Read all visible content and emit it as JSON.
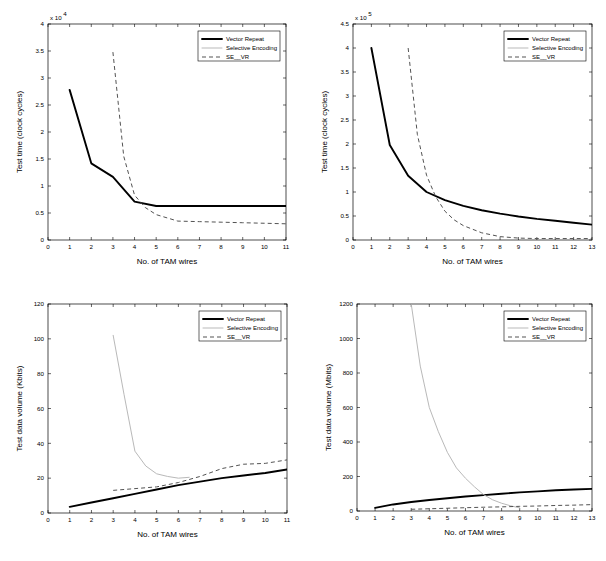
{
  "figure": {
    "title": "",
    "series_names": [
      "Vector Repeat",
      "Selective Encoding",
      "SE__VR"
    ],
    "colors": {
      "vector_repeat": "#000000",
      "selective_encoding": "#b9b9b9",
      "se_vr": "#4a4a4a",
      "axis": "#000000",
      "background": "#ffffff"
    }
  },
  "chart_data": [
    {
      "id": "top-left",
      "type": "line",
      "title": "",
      "xlabel": "No. of TAM wires",
      "ylabel": "Test time (clock cycles)",
      "y_multiplier": "x 10",
      "y_multiplier_exponent": "4",
      "xlim": [
        0,
        11
      ],
      "ylim": [
        0,
        4
      ],
      "xticks": [
        0,
        1,
        2,
        3,
        4,
        5,
        6,
        7,
        8,
        9,
        10,
        11
      ],
      "xticklabels": [
        "0",
        "1",
        "2",
        "3",
        "4",
        "5",
        "6",
        "7",
        "8",
        "9",
        "10",
        "11"
      ],
      "yticks": [
        0,
        0.5,
        1,
        1.5,
        2,
        2.5,
        3,
        3.5,
        4
      ],
      "yticklabels": [
        "0",
        "0.5",
        "1",
        "1.5",
        "2",
        "2.5",
        "3",
        "3.5",
        "4"
      ],
      "grid": false,
      "legend_position": "upper right",
      "series": [
        {
          "name": "Vector Repeat",
          "style": "solid-thick",
          "x": [
            1,
            2,
            3,
            4,
            5,
            6,
            7,
            8,
            9,
            10,
            11
          ],
          "y": [
            2.78,
            1.42,
            1.17,
            0.71,
            0.63,
            0.63,
            0.63,
            0.63,
            0.63,
            0.63,
            0.63
          ]
        },
        {
          "name": "Selective Encoding",
          "style": "solid-thin-gray",
          "x": [],
          "y": []
        },
        {
          "name": "SE__VR",
          "style": "dashed",
          "x": [
            3,
            3.5,
            4,
            4.5,
            5,
            6,
            7,
            8,
            9,
            10,
            11
          ],
          "y": [
            3.48,
            1.55,
            0.83,
            0.6,
            0.47,
            0.35,
            0.34,
            0.33,
            0.32,
            0.31,
            0.3
          ]
        }
      ]
    },
    {
      "id": "top-right",
      "type": "line",
      "title": "",
      "xlabel": "No. of TAM wires",
      "ylabel": "Test time (clock cycles)",
      "y_multiplier": "x 10",
      "y_multiplier_exponent": "5",
      "xlim": [
        0,
        13
      ],
      "ylim": [
        0,
        4.5
      ],
      "xticks": [
        0,
        1,
        2,
        3,
        4,
        5,
        6,
        7,
        8,
        9,
        10,
        11,
        12,
        13
      ],
      "xticklabels": [
        "0",
        "1",
        "2",
        "3",
        "4",
        "5",
        "6",
        "7",
        "8",
        "9",
        "10",
        "11",
        "12",
        "13"
      ],
      "yticks": [
        0,
        0.5,
        1,
        1.5,
        2,
        2.5,
        3,
        3.5,
        4,
        4.5
      ],
      "yticklabels": [
        "0",
        "0.5",
        "1",
        "1.5",
        "2",
        "2.5",
        "3",
        "3.5",
        "4",
        "4.5"
      ],
      "grid": false,
      "legend_position": "upper right",
      "series": [
        {
          "name": "Vector Repeat",
          "style": "solid-thick",
          "x": [
            1,
            2,
            3,
            4,
            5,
            6,
            7,
            8,
            9,
            10,
            11,
            12,
            13
          ],
          "y": [
            4.0,
            1.98,
            1.34,
            1.0,
            0.83,
            0.71,
            0.62,
            0.55,
            0.49,
            0.44,
            0.4,
            0.36,
            0.32
          ]
        },
        {
          "name": "Selective Encoding",
          "style": "solid-thin-gray",
          "x": [],
          "y": []
        },
        {
          "name": "SE__VR",
          "style": "dashed",
          "x": [
            3,
            3.5,
            4,
            4.5,
            5,
            5.5,
            6,
            7,
            8,
            9,
            10,
            11,
            12,
            13
          ],
          "y": [
            4.0,
            2.2,
            1.35,
            0.9,
            0.6,
            0.42,
            0.3,
            0.15,
            0.07,
            0.04,
            0.03,
            0.03,
            0.03,
            0.03
          ]
        }
      ]
    },
    {
      "id": "bottom-left",
      "type": "line",
      "title": "",
      "xlabel": "No. of TAM wires",
      "ylabel": "Test data volume (Kbits)",
      "y_multiplier": "",
      "y_multiplier_exponent": "",
      "xlim": [
        0,
        11
      ],
      "ylim": [
        0,
        120
      ],
      "xticks": [
        0,
        1,
        2,
        3,
        4,
        5,
        6,
        7,
        8,
        9,
        10,
        11
      ],
      "xticklabels": [
        "0",
        "1",
        "2",
        "3",
        "4",
        "5",
        "6",
        "7",
        "8",
        "9",
        "10",
        "11"
      ],
      "yticks": [
        0,
        20,
        40,
        60,
        80,
        100,
        120
      ],
      "yticklabels": [
        "0",
        "20",
        "40",
        "60",
        "80",
        "100",
        "120"
      ],
      "grid": false,
      "legend_position": "upper right",
      "series": [
        {
          "name": "Vector Repeat",
          "style": "solid-thick",
          "x": [
            1,
            2,
            3,
            4,
            5,
            6,
            7,
            8,
            9,
            10,
            11
          ],
          "y": [
            3.5,
            6.0,
            8.5,
            11.0,
            13.5,
            16.0,
            18.0,
            20.0,
            21.5,
            23.0,
            25.0
          ]
        },
        {
          "name": "Selective Encoding",
          "style": "solid-thin-gray",
          "x": [
            3,
            3.5,
            4,
            4.5,
            5,
            5.5,
            6,
            6.5
          ],
          "y": [
            102.0,
            68.0,
            35.5,
            27.0,
            22.5,
            21.0,
            20.0,
            20.5
          ]
        },
        {
          "name": "SE__VR",
          "style": "dashed",
          "x": [
            3,
            4,
            5,
            6,
            7,
            8,
            9,
            10,
            11
          ],
          "y": [
            13.0,
            14.0,
            15.0,
            17.5,
            21.0,
            25.5,
            28.0,
            28.5,
            30.5
          ]
        }
      ]
    },
    {
      "id": "bottom-right",
      "type": "line",
      "title": "",
      "xlabel": "No. of TAM wires",
      "ylabel": "Test data volume (Mbits)",
      "y_multiplier": "",
      "y_multiplier_exponent": "",
      "xlim": [
        0,
        13
      ],
      "ylim": [
        0,
        1200
      ],
      "xticks": [
        0,
        1,
        2,
        3,
        4,
        5,
        6,
        7,
        8,
        9,
        10,
        11,
        12,
        13
      ],
      "xticklabels": [
        "0",
        "1",
        "2",
        "3",
        "4",
        "5",
        "6",
        "7",
        "8",
        "9",
        "10",
        "11",
        "12",
        "13"
      ],
      "yticks": [
        0,
        200,
        400,
        600,
        800,
        1000,
        1200
      ],
      "yticklabels": [
        "0",
        "200",
        "400",
        "600",
        "800",
        "1000",
        "1200"
      ],
      "grid": false,
      "legend_position": "upper right",
      "series": [
        {
          "name": "Vector Repeat",
          "style": "solid-thick",
          "x": [
            1,
            2,
            3,
            4,
            5,
            6,
            7,
            8,
            9,
            10,
            11,
            12,
            13
          ],
          "y": [
            18,
            38,
            52,
            64,
            74,
            84,
            92,
            100,
            108,
            114,
            120,
            125,
            128
          ]
        },
        {
          "name": "Selective Encoding",
          "style": "solid-thin-gray",
          "x": [
            3,
            3.5,
            4,
            4.5,
            5,
            5.5,
            6,
            6.5,
            7,
            7.5,
            8,
            8.5,
            9
          ],
          "y": [
            1200,
            840,
            600,
            460,
            340,
            250,
            190,
            140,
            95,
            65,
            45,
            30,
            18
          ]
        },
        {
          "name": "SE__VR",
          "style": "dashed",
          "x": [
            3,
            4,
            5,
            6,
            7,
            8,
            9,
            10,
            11,
            12,
            13
          ],
          "y": [
            10,
            13,
            16,
            19,
            22,
            24,
            27,
            29,
            32,
            34,
            37
          ]
        }
      ]
    }
  ]
}
